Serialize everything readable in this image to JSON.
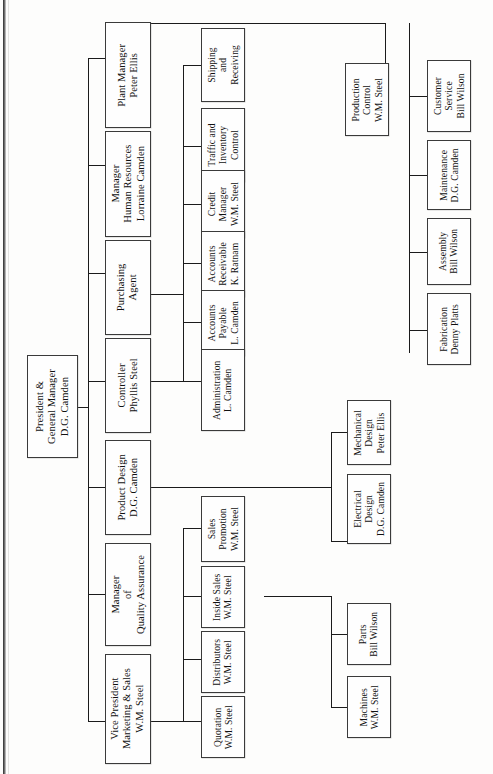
{
  "chart_title": "Company Organizational Chart",
  "orientation": "rotated-90",
  "colors": {
    "line": "#1b1b1b",
    "box_border": "#3a3a3a",
    "box_fill": "#fefefe",
    "page": "#fdfdfc"
  },
  "nodes": {
    "president": {
      "lines": [
        "President &",
        "General Manager",
        "D.G. Camden"
      ]
    },
    "plant_manager": {
      "lines": [
        "Plant Manager",
        "Peter Ellis"
      ]
    },
    "human_resources": {
      "lines": [
        "Manager",
        "Human Resources",
        "Lorraine Camden"
      ]
    },
    "purchasing": {
      "lines": [
        "Purchasing",
        "Agent"
      ]
    },
    "controller": {
      "lines": [
        "Controller",
        "Phyllis Steel"
      ]
    },
    "product_design": {
      "lines": [
        "Product Design",
        "D.G. Camden"
      ]
    },
    "quality_assurance": {
      "lines": [
        "Manager",
        "of",
        "Quality Assurance"
      ]
    },
    "vice_president": {
      "lines": [
        "Vice President",
        "Marketing & Sales",
        "W.M. Steel"
      ]
    },
    "shipping": {
      "lines": [
        "Shipping",
        "and",
        "Receiving"
      ]
    },
    "traffic": {
      "lines": [
        "Traffic and",
        "Inventory",
        "Control"
      ]
    },
    "credit": {
      "lines": [
        "Credit",
        "Manager",
        "W.M. Steel"
      ]
    },
    "accounts_receivable": {
      "lines": [
        "Accounts",
        "Receivable",
        "K. Ratnam"
      ]
    },
    "accounts_payable": {
      "lines": [
        "Accounts",
        "Payable",
        "L. Camden"
      ]
    },
    "administration": {
      "lines": [
        "Administration",
        "L. Camden"
      ]
    },
    "sales_promotion": {
      "lines": [
        "Sales",
        "Promotion",
        "W.M. Steel"
      ]
    },
    "inside_sales": {
      "lines": [
        "Inside Sales",
        "W.M. Steel"
      ]
    },
    "distributors": {
      "lines": [
        "Distributors",
        "W.M. Steel"
      ]
    },
    "quotation": {
      "lines": [
        "Quotation",
        "W.M. Steel"
      ]
    },
    "production_control": {
      "lines": [
        "Production",
        "Control",
        "W.M. Steel"
      ]
    },
    "mechanical_design": {
      "lines": [
        "Mechanical",
        "Design",
        "Peter Ellis"
      ]
    },
    "electrical_design": {
      "lines": [
        "Electrical",
        "Design",
        "D.G. Camden"
      ]
    },
    "parts": {
      "lines": [
        "Parts",
        "Bill Wilson"
      ]
    },
    "machines": {
      "lines": [
        "Machines",
        "W.M. Steel"
      ]
    },
    "customer_service": {
      "lines": [
        "Customer",
        "Service",
        "Bill Wilson"
      ]
    },
    "maintenance": {
      "lines": [
        "Maintenance",
        "D.G. Camden"
      ]
    },
    "assembly": {
      "lines": [
        "Assembly",
        "Bill Wilson"
      ]
    },
    "fabrication": {
      "lines": [
        "Fabrication",
        "Denny Platts"
      ]
    }
  },
  "hierarchy": {
    "root": "president",
    "edges": [
      [
        "president",
        "plant_manager"
      ],
      [
        "president",
        "human_resources"
      ],
      [
        "president",
        "purchasing"
      ],
      [
        "president",
        "controller"
      ],
      [
        "president",
        "product_design"
      ],
      [
        "president",
        "quality_assurance"
      ],
      [
        "president",
        "vice_president"
      ],
      [
        "plant_manager",
        "shipping"
      ],
      [
        "plant_manager",
        "traffic"
      ],
      [
        "plant_manager",
        "production_control"
      ],
      [
        "production_control",
        "customer_service"
      ],
      [
        "production_control",
        "maintenance"
      ],
      [
        "production_control",
        "assembly"
      ],
      [
        "production_control",
        "fabrication"
      ],
      [
        "controller",
        "credit"
      ],
      [
        "controller",
        "accounts_receivable"
      ],
      [
        "controller",
        "accounts_payable"
      ],
      [
        "controller",
        "administration"
      ],
      [
        "product_design",
        "mechanical_design"
      ],
      [
        "product_design",
        "electrical_design"
      ],
      [
        "vice_president",
        "sales_promotion"
      ],
      [
        "vice_president",
        "inside_sales"
      ],
      [
        "vice_president",
        "distributors"
      ],
      [
        "vice_president",
        "quotation"
      ],
      [
        "inside_sales",
        "parts"
      ],
      [
        "inside_sales",
        "machines"
      ]
    ]
  }
}
